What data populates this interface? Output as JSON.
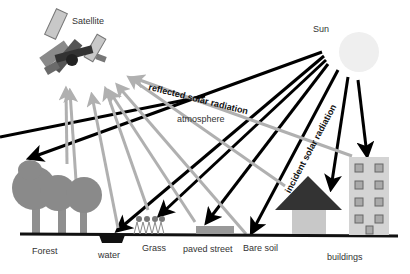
{
  "labels": {
    "satellite": "Satellite",
    "sun": "Sun",
    "reflected": "reflected solar radiation",
    "atmosphere": "atmosphere",
    "incident": "incident solar radiation",
    "forest": "Forest",
    "water": "water",
    "grass": "Grass",
    "paved_street": "paved street",
    "bare_soil": "Bare soil",
    "buildings": "buildings"
  },
  "colors": {
    "incident_arrow": "#000000",
    "reflected_arrow": "#b0b0b0",
    "sun": "#efefef",
    "tree": "#8a8a8a",
    "trunk": "#8f8f8f",
    "house_roof": "#333333",
    "house_body": "#c8c8c8",
    "building": "#d4d4d4",
    "window": "#8a8a8a",
    "ground": "#111111",
    "paved": "#999999"
  }
}
